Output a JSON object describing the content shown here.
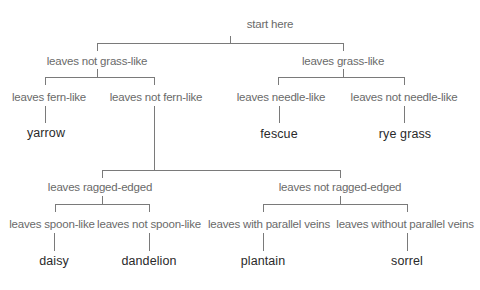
{
  "diagram": {
    "type": "dichotomous-key",
    "line_color": "#7a7a7a",
    "label_color": "#6a6a6a",
    "leaf_color": "#2a2a2a",
    "root": {
      "label": "start here"
    },
    "level1": {
      "left": {
        "label": "leaves not grass-like"
      },
      "right": {
        "label": "leaves grass-like"
      }
    },
    "level2": {
      "fern_like": {
        "label": "leaves fern-like"
      },
      "not_fern_like": {
        "label": "leaves not fern-like"
      },
      "needle_like": {
        "label": "leaves needle-like"
      },
      "not_needle_like": {
        "label": "leaves not needle-like"
      }
    },
    "level2_results": {
      "yarrow": "yarrow",
      "fescue": "fescue",
      "rye_grass": "rye grass"
    },
    "level3": {
      "ragged": {
        "label": "leaves ragged-edged"
      },
      "not_ragged": {
        "label": "leaves not ragged-edged"
      }
    },
    "level4": {
      "spoon_like": {
        "label": "leaves spoon-like"
      },
      "not_spoon_like": {
        "label": "leaves not spoon-like"
      },
      "parallel_veins": {
        "label": "leaves with parallel veins"
      },
      "without_parallel_veins": {
        "label": "leaves without parallel veins"
      }
    },
    "level4_results": {
      "daisy": "daisy",
      "dandelion": "dandelion",
      "plantain": "plantain",
      "sorrel": "sorrel"
    }
  }
}
